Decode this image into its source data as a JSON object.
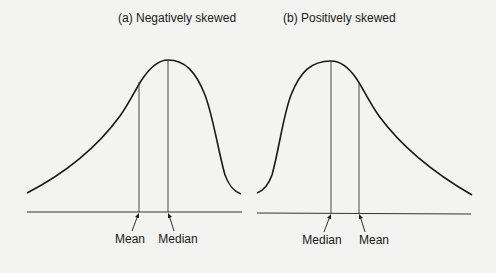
{
  "panels": [
    {
      "title": "(a) Negatively skewed",
      "labels": {
        "left": "Mean",
        "right": "Median"
      }
    },
    {
      "title": "(b) Positively skewed",
      "labels": {
        "left": "Median",
        "right": "Mean"
      }
    }
  ],
  "colors": {
    "background": "#f3f3f1",
    "stroke": "#1a1a1a",
    "text": "#1a1a1a"
  }
}
